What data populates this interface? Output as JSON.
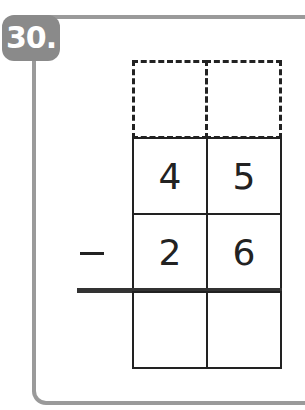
{
  "problem": {
    "number": "30.",
    "operator": "−",
    "carry_row": [
      "",
      ""
    ],
    "minuend": [
      "4",
      "5"
    ],
    "subtrahend": [
      "2",
      "6"
    ],
    "answer": [
      "",
      ""
    ]
  },
  "colors": {
    "frame": "#9a9a9a",
    "badge": "#8a8a8a",
    "ink": "#222222"
  }
}
